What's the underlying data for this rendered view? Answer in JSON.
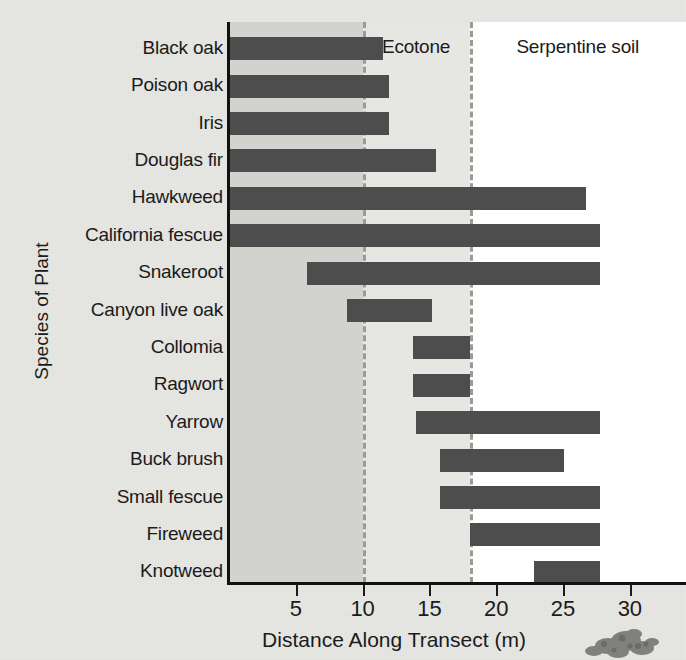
{
  "chart_data": {
    "type": "bar",
    "orientation": "horizontal",
    "title": "",
    "xlabel": "Distance Along Transect (m)",
    "ylabel": "Species of Plant",
    "xlim": [
      0,
      34.2
    ],
    "xticks": [
      5,
      10,
      15,
      20,
      25,
      30
    ],
    "grid": false,
    "legend": null,
    "bar_color": "#4d4d4d",
    "categories": [
      "Black oak",
      "Poison oak",
      "Iris",
      "Douglas fir",
      "Hawkweed",
      "California fescue",
      "Snakeroot",
      "Canyon live oak",
      "Collomia",
      "Ragwort",
      "Yarrow",
      "Buck brush",
      "Small fescue",
      "Fireweed",
      "Knotweed"
    ],
    "bars": [
      {
        "label": "Black oak",
        "start": 0,
        "end": 11.5
      },
      {
        "label": "Poison oak",
        "start": 0,
        "end": 12.0
      },
      {
        "label": "Iris",
        "start": 0,
        "end": 12.0
      },
      {
        "label": "Douglas fir",
        "start": 0,
        "end": 15.5
      },
      {
        "label": "Hawkweed",
        "start": 0,
        "end": 26.7
      },
      {
        "label": "California fescue",
        "start": 0,
        "end": 27.8
      },
      {
        "label": "Snakeroot",
        "start": 5.8,
        "end": 27.8
      },
      {
        "label": "Canyon live oak",
        "start": 8.8,
        "end": 15.2
      },
      {
        "label": "Collomia",
        "start": 13.8,
        "end": 18.0
      },
      {
        "label": "Ragwort",
        "start": 13.8,
        "end": 18.0
      },
      {
        "label": "Yarrow",
        "start": 14.0,
        "end": 27.8
      },
      {
        "label": "Buck brush",
        "start": 15.8,
        "end": 25.1
      },
      {
        "label": "Small fescue",
        "start": 15.8,
        "end": 27.8
      },
      {
        "label": "Fireweed",
        "start": 18.0,
        "end": 27.8
      },
      {
        "label": "Knotweed",
        "start": 22.8,
        "end": 27.8
      }
    ],
    "zones": [
      {
        "name": "Normal soil",
        "start": 0,
        "end": 10.0,
        "color": "#d2d2cf"
      },
      {
        "name": "Ecotone",
        "start": 10.0,
        "end": 18.0,
        "color": "#e6e6e3"
      },
      {
        "name": "Serpentine soil",
        "start": 18.0,
        "end": 34.2,
        "color": "#ffffff"
      }
    ],
    "zone_boundaries": [
      10.0,
      18.0
    ],
    "annotations": []
  },
  "decor": {
    "plant_photo": "plant-photo"
  }
}
